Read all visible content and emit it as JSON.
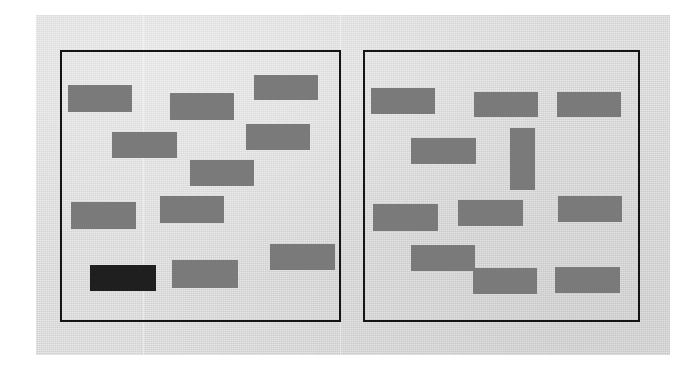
{
  "document": {
    "title": "Scanned two-panel redacted layout diagram",
    "background_color": "#ffffff",
    "page_color": "#d9d9d9",
    "page_rect": {
      "x": 36,
      "y": 15,
      "width": 634,
      "height": 340
    }
  },
  "panels": [
    {
      "id": "left-panel",
      "label": "Left panel",
      "border_color": "#141414",
      "border_width": 2,
      "rect": {
        "x": 60,
        "y": 50,
        "width": 281,
        "height": 272
      },
      "blocks": [
        {
          "id": "l1",
          "label": "block-1",
          "x": 68,
          "y": 85,
          "width": 64,
          "height": 27,
          "color": "#7a7a7a",
          "orientation": "horizontal"
        },
        {
          "id": "l2",
          "label": "block-2",
          "x": 170,
          "y": 93,
          "width": 64,
          "height": 27,
          "color": "#7a7a7a",
          "orientation": "horizontal"
        },
        {
          "id": "l3",
          "label": "block-3",
          "x": 254,
          "y": 75,
          "width": 64,
          "height": 25,
          "color": "#7a7a7a",
          "orientation": "horizontal"
        },
        {
          "id": "l4",
          "label": "block-4",
          "x": 246,
          "y": 124,
          "width": 64,
          "height": 26,
          "color": "#7a7a7a",
          "orientation": "horizontal"
        },
        {
          "id": "l5",
          "label": "block-5",
          "x": 112,
          "y": 132,
          "width": 65,
          "height": 26,
          "color": "#7a7a7a",
          "orientation": "horizontal"
        },
        {
          "id": "l6",
          "label": "block-6",
          "x": 190,
          "y": 160,
          "width": 64,
          "height": 26,
          "color": "#7a7a7a",
          "orientation": "horizontal"
        },
        {
          "id": "l7",
          "label": "block-7",
          "x": 160,
          "y": 196,
          "width": 64,
          "height": 27,
          "color": "#7a7a7a",
          "orientation": "horizontal"
        },
        {
          "id": "l8",
          "label": "block-8",
          "x": 71,
          "y": 202,
          "width": 65,
          "height": 27,
          "color": "#7a7a7a",
          "orientation": "horizontal"
        },
        {
          "id": "l9",
          "label": "block-9",
          "x": 270,
          "y": 244,
          "width": 65,
          "height": 26,
          "color": "#7a7a7a",
          "orientation": "horizontal"
        },
        {
          "id": "l10",
          "label": "block-10-dark",
          "x": 90,
          "y": 265,
          "width": 66,
          "height": 26,
          "color": "#1f1f1f",
          "orientation": "horizontal"
        },
        {
          "id": "l11",
          "label": "block-11",
          "x": 172,
          "y": 260,
          "width": 66,
          "height": 28,
          "color": "#7a7a7a",
          "orientation": "horizontal"
        }
      ]
    },
    {
      "id": "right-panel",
      "label": "Right panel",
      "border_color": "#141414",
      "border_width": 2,
      "rect": {
        "x": 363,
        "y": 50,
        "width": 277,
        "height": 272
      },
      "blocks": [
        {
          "id": "r1",
          "label": "block-1",
          "x": 371,
          "y": 88,
          "width": 64,
          "height": 26,
          "color": "#7a7a7a",
          "orientation": "horizontal"
        },
        {
          "id": "r2",
          "label": "block-2",
          "x": 474,
          "y": 92,
          "width": 64,
          "height": 25,
          "color": "#7a7a7a",
          "orientation": "horizontal"
        },
        {
          "id": "r3",
          "label": "block-3",
          "x": 557,
          "y": 92,
          "width": 64,
          "height": 25,
          "color": "#7a7a7a",
          "orientation": "horizontal"
        },
        {
          "id": "r4",
          "label": "block-4",
          "x": 411,
          "y": 138,
          "width": 65,
          "height": 26,
          "color": "#7a7a7a",
          "orientation": "horizontal"
        },
        {
          "id": "r5",
          "label": "block-5-vertical",
          "x": 510,
          "y": 128,
          "width": 25,
          "height": 62,
          "color": "#7a7a7a",
          "orientation": "vertical"
        },
        {
          "id": "r6",
          "label": "block-6",
          "x": 373,
          "y": 204,
          "width": 65,
          "height": 27,
          "color": "#7a7a7a",
          "orientation": "horizontal"
        },
        {
          "id": "r7",
          "label": "block-7",
          "x": 458,
          "y": 200,
          "width": 65,
          "height": 26,
          "color": "#7a7a7a",
          "orientation": "horizontal"
        },
        {
          "id": "r8",
          "label": "block-8",
          "x": 558,
          "y": 196,
          "width": 64,
          "height": 26,
          "color": "#7a7a7a",
          "orientation": "horizontal"
        },
        {
          "id": "r9",
          "label": "block-9",
          "x": 411,
          "y": 245,
          "width": 64,
          "height": 26,
          "color": "#7a7a7a",
          "orientation": "horizontal"
        },
        {
          "id": "r10",
          "label": "block-10",
          "x": 473,
          "y": 268,
          "width": 64,
          "height": 26,
          "color": "#7a7a7a",
          "orientation": "horizontal"
        },
        {
          "id": "r11",
          "label": "block-11",
          "x": 555,
          "y": 267,
          "width": 65,
          "height": 26,
          "color": "#7a7a7a",
          "orientation": "horizontal"
        }
      ]
    }
  ],
  "artifacts": {
    "scan_seams": [
      {
        "id": "seam-1",
        "x": 143
      },
      {
        "id": "seam-2",
        "x": 340
      }
    ]
  }
}
